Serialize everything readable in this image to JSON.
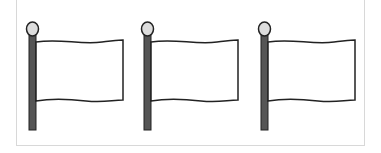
{
  "flags": [
    {
      "label": "flag-1",
      "pole_color": "#555555",
      "finial_color": "#dddddd",
      "cloth_color": "#ffffff"
    },
    {
      "label": "flag-2",
      "pole_color": "#555555",
      "finial_color": "#dddddd",
      "cloth_color": "#ffffff"
    },
    {
      "label": "flag-3",
      "pole_color": "#555555",
      "finial_color": "#dddddd",
      "cloth_color": "#ffffff"
    }
  ]
}
